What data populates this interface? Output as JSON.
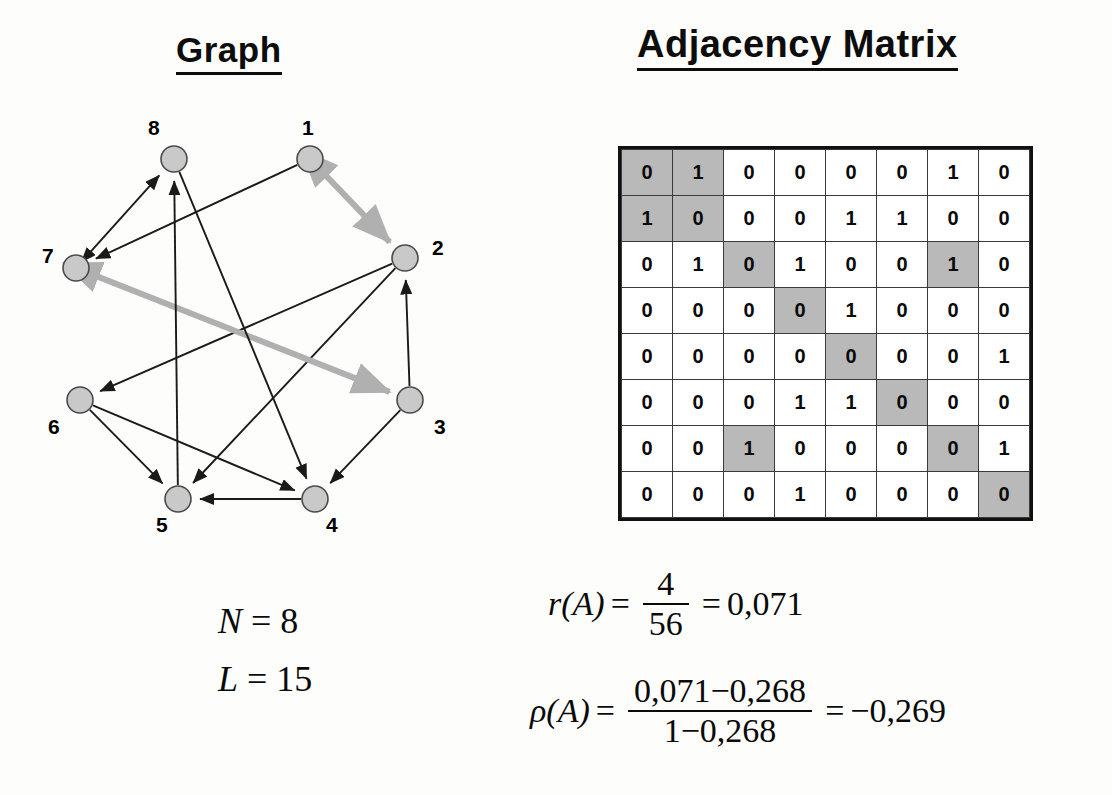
{
  "titles": {
    "graph": "Graph",
    "matrix": "Adjacency Matrix"
  },
  "graph": {
    "nodes": [
      {
        "id": "1",
        "label": "1",
        "cx": 310,
        "cy": 69,
        "label_x": 302,
        "label_y": 26
      },
      {
        "id": "2",
        "label": "2",
        "cx": 405,
        "cy": 168,
        "label_x": 432,
        "label_y": 146
      },
      {
        "id": "3",
        "label": "3",
        "cx": 410,
        "cy": 310,
        "label_x": 434,
        "label_y": 325
      },
      {
        "id": "4",
        "label": "4",
        "cx": 315,
        "cy": 409,
        "label_x": 326,
        "label_y": 423
      },
      {
        "id": "5",
        "label": "5",
        "cx": 178,
        "cy": 409,
        "label_x": 156,
        "label_y": 423
      },
      {
        "id": "6",
        "label": "6",
        "cx": 80,
        "cy": 310,
        "label_x": 48,
        "label_y": 325
      },
      {
        "id": "7",
        "label": "7",
        "cx": 76,
        "cy": 178,
        "label_x": 42,
        "label_y": 154
      },
      {
        "id": "8",
        "label": "8",
        "cx": 174,
        "cy": 69,
        "label_x": 148,
        "label_y": 26
      }
    ],
    "node_radius": 13,
    "node_fill": "#c9c9c9",
    "node_stroke": "#4a4a4a",
    "edge_color": "#1a1a1a",
    "bidir_edge_color": "#b0b0b0",
    "edges": [
      {
        "from": "1",
        "to": "2",
        "style": "bidirectional",
        "note": "1 and 2 reciprocal"
      },
      {
        "from": "1",
        "to": "7",
        "style": "directed"
      },
      {
        "from": "2",
        "to": "5",
        "style": "directed"
      },
      {
        "from": "2",
        "to": "6",
        "style": "directed"
      },
      {
        "from": "3",
        "to": "2",
        "style": "directed"
      },
      {
        "from": "3",
        "to": "4",
        "style": "directed"
      },
      {
        "from": "7",
        "to": "3",
        "style": "bidirectional",
        "note": "7 and 3 reciprocal"
      },
      {
        "from": "4",
        "to": "5",
        "style": "directed"
      },
      {
        "from": "5",
        "to": "8",
        "style": "directed"
      },
      {
        "from": "6",
        "to": "4",
        "style": "directed"
      },
      {
        "from": "6",
        "to": "5",
        "style": "directed"
      },
      {
        "from": "7",
        "to": "8",
        "style": "bidirectional-black",
        "note": "8 and 7 reciprocal"
      },
      {
        "from": "8",
        "to": "4",
        "style": "directed"
      }
    ]
  },
  "matrix": {
    "size": 8,
    "rows": [
      [
        "0",
        "1",
        "0",
        "0",
        "0",
        "0",
        "1",
        "0"
      ],
      [
        "1",
        "0",
        "0",
        "0",
        "1",
        "1",
        "0",
        "0"
      ],
      [
        "0",
        "1",
        "0",
        "1",
        "0",
        "0",
        "1",
        "0"
      ],
      [
        "0",
        "0",
        "0",
        "0",
        "1",
        "0",
        "0",
        "0"
      ],
      [
        "0",
        "0",
        "0",
        "0",
        "0",
        "0",
        "0",
        "1"
      ],
      [
        "0",
        "0",
        "0",
        "1",
        "1",
        "0",
        "0",
        "0"
      ],
      [
        "0",
        "0",
        "1",
        "0",
        "0",
        "0",
        "0",
        "1"
      ],
      [
        "0",
        "0",
        "0",
        "1",
        "0",
        "0",
        "0",
        "0"
      ]
    ],
    "highlighted_cells": [
      [
        0,
        0
      ],
      [
        0,
        1
      ],
      [
        1,
        0
      ],
      [
        1,
        1
      ],
      [
        2,
        2
      ],
      [
        2,
        6
      ],
      [
        3,
        3
      ],
      [
        4,
        4
      ],
      [
        5,
        5
      ],
      [
        6,
        2
      ],
      [
        6,
        6
      ],
      [
        7,
        7
      ]
    ],
    "highlight_color": "#b9b9b9",
    "cell_color": "#ffffff"
  },
  "stats": {
    "n_symbol": "N",
    "n_eq": "=",
    "n_value": "8",
    "l_symbol": "L",
    "l_eq": "=",
    "l_value": "15"
  },
  "formulas": {
    "r": {
      "lhs": "r(A)",
      "eq1": "=",
      "numerator": "4",
      "denominator": "56",
      "eq2": "=",
      "result": "0,071"
    },
    "rho": {
      "lhs_symbol": "ρ",
      "lhs_arg": "(A)",
      "eq1": "=",
      "numerator": "0,071−0,268",
      "denominator": "1−0,268",
      "eq2": "=",
      "result": "−0,269"
    }
  }
}
